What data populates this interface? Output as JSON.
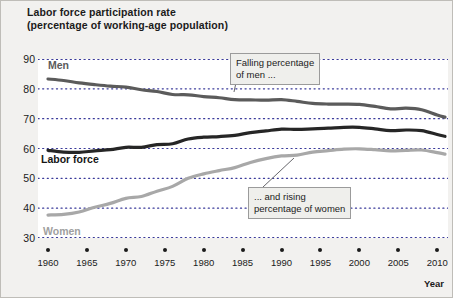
{
  "title": {
    "line1": "Labor force participation rate",
    "line2": "(percentage of working-age population)"
  },
  "axis": {
    "x_title": "Year",
    "y_ticks": [
      "90",
      "80",
      "70",
      "60",
      "50",
      "40",
      "30"
    ],
    "x_ticks": [
      "1960",
      "1965",
      "1970",
      "1975",
      "1980",
      "1985",
      "1990",
      "1995",
      "2000",
      "2005",
      "2010"
    ]
  },
  "series_labels": {
    "men": "Men",
    "labor_force": "Labor force",
    "women": "Women"
  },
  "annotations": {
    "men_note_line1": "Falling percentage",
    "men_note_line2": "of men ...",
    "women_note_line1": "... and rising",
    "women_note_line2": "percentage of women"
  },
  "colors": {
    "men": "#5b5b5b",
    "labor_force": "#262626",
    "women": "#a8a8a8",
    "grid": "#3a3a9a",
    "plot_bg": "#ffffff",
    "page_bg": "#f2f1ef"
  },
  "chart_data": {
    "type": "line",
    "title": "Labor force participation rate (percentage of working-age population)",
    "xlabel": "Year",
    "ylabel": "Percentage of working-age population",
    "xlim": [
      1960,
      2011
    ],
    "ylim": [
      30,
      90
    ],
    "y_tick_interval": 10,
    "x_tick_interval": 5,
    "grid": "horizontal-dotted",
    "legend": "inline-labels",
    "x": [
      1960,
      1962,
      1964,
      1966,
      1968,
      1970,
      1972,
      1974,
      1976,
      1978,
      1980,
      1982,
      1984,
      1986,
      1988,
      1990,
      1992,
      1994,
      1996,
      1998,
      2000,
      2002,
      2004,
      2006,
      2008,
      2010,
      2011
    ],
    "series": [
      {
        "name": "Men",
        "color": "#5b5b5b",
        "values": [
          83.3,
          82.8,
          82.0,
          81.4,
          80.9,
          80.6,
          79.7,
          79.1,
          78.1,
          78.0,
          77.4,
          77.0,
          76.4,
          76.3,
          76.2,
          76.4,
          75.8,
          75.1,
          74.9,
          74.9,
          74.8,
          74.1,
          73.3,
          73.5,
          73.0,
          71.2,
          70.5
        ]
      },
      {
        "name": "Labor force",
        "color": "#262626",
        "values": [
          59.4,
          58.8,
          58.7,
          59.2,
          59.6,
          60.4,
          60.4,
          61.3,
          61.6,
          63.2,
          63.8,
          64.0,
          64.4,
          65.3,
          65.9,
          66.5,
          66.4,
          66.6,
          66.8,
          67.1,
          67.1,
          66.6,
          66.0,
          66.2,
          66.0,
          64.7,
          64.1
        ]
      },
      {
        "name": "Women",
        "color": "#a8a8a8",
        "values": [
          37.7,
          37.9,
          38.7,
          40.3,
          41.6,
          43.3,
          43.9,
          45.7,
          47.3,
          50.0,
          51.5,
          52.6,
          53.6,
          55.3,
          56.6,
          57.5,
          57.8,
          58.8,
          59.3,
          59.8,
          59.9,
          59.6,
          59.2,
          59.4,
          59.5,
          58.6,
          58.1
        ]
      }
    ]
  }
}
